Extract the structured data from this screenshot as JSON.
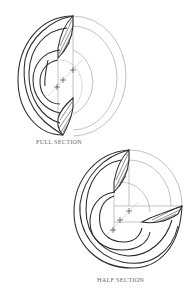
{
  "figures": [
    {
      "id": "full-section",
      "caption": "FULL SECTION"
    },
    {
      "id": "half-section",
      "caption": "HALF SECTION"
    }
  ],
  "colors": {
    "line_dark": "#2a2a2a",
    "line_light": "#9a9a9a",
    "caption": "#6b6b6b",
    "background": "#ffffff"
  }
}
